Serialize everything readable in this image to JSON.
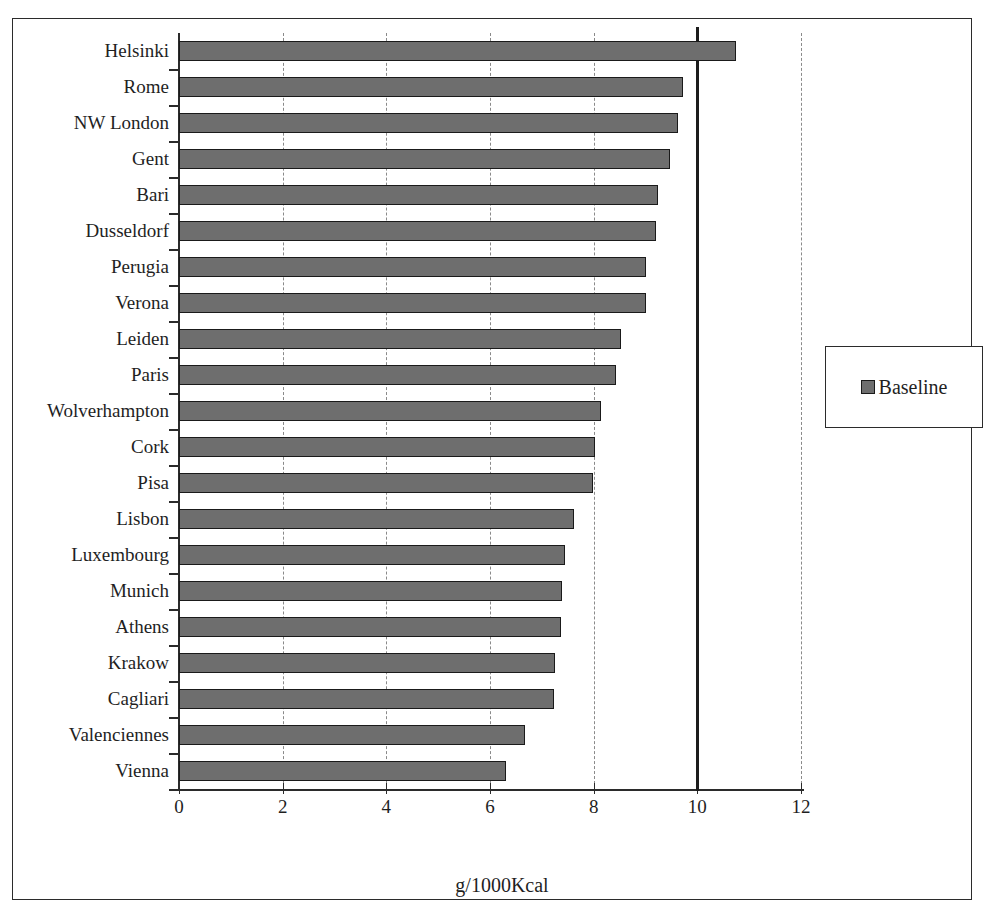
{
  "chart_data": {
    "type": "bar",
    "orientation": "horizontal",
    "title": "",
    "xlabel": "g/1000Kcal",
    "ylabel": "",
    "xlim": [
      0,
      12
    ],
    "ylim": null,
    "grid": true,
    "xticks": [
      0,
      2,
      4,
      6,
      8,
      10,
      12
    ],
    "xticklabels": [
      "0",
      "2",
      "4",
      "6",
      "8",
      "10",
      "12"
    ],
    "reference_line": {
      "value": 10,
      "style": "solid",
      "color": "#1d1d1d"
    },
    "legend": {
      "position": "right",
      "entries": [
        "Baseline"
      ]
    },
    "series": [
      {
        "name": "Baseline",
        "color": "#6e6e6e",
        "edge_color": "#1a1a1a",
        "values": [
          10.75,
          9.73,
          9.63,
          9.48,
          9.25,
          9.2,
          9.0,
          9.0,
          8.53,
          8.43,
          8.15,
          8.02,
          7.98,
          7.62,
          7.45,
          7.38,
          7.37,
          7.26,
          7.23,
          6.68,
          6.3
        ]
      }
    ],
    "categories": [
      "Helsinki",
      "Rome",
      "NW London",
      "Gent",
      "Bari",
      "Dusseldorf",
      "Perugia",
      "Verona",
      "Leiden",
      "Paris",
      "Wolverhampton",
      "Cork",
      "Pisa",
      "Lisbon",
      "Luxembourg",
      "Munich",
      "Athens",
      "Krakow",
      "Cagliari",
      "Valenciennes",
      "Vienna"
    ]
  },
  "legend": {
    "swatch_icon": "legend-square-icon",
    "label": "Baseline"
  },
  "axis": {
    "x_title": "g/1000Kcal"
  }
}
